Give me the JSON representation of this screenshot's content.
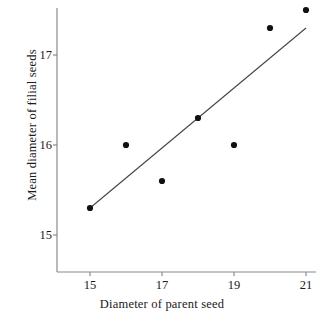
{
  "chart_data": {
    "type": "scatter",
    "title": "",
    "xlabel": "Diameter of parent seed",
    "ylabel": "Mean diameter of filial seeds",
    "x": [
      15,
      16,
      17,
      18,
      19,
      20,
      21
    ],
    "y": [
      15.3,
      16.0,
      15.6,
      16.3,
      16.0,
      17.3,
      17.5
    ],
    "points": [
      {
        "x": 15,
        "y": 15.3
      },
      {
        "x": 16,
        "y": 16.0
      },
      {
        "x": 17,
        "y": 15.6
      },
      {
        "x": 18,
        "y": 16.3
      },
      {
        "x": 19,
        "y": 16.0
      },
      {
        "x": 20,
        "y": 17.3
      },
      {
        "x": 21,
        "y": 17.5
      }
    ],
    "xlim": [
      14.2,
      21.4
    ],
    "ylim": [
      14.5,
      17.75
    ],
    "xticks": [
      15,
      17,
      19,
      21
    ],
    "yticks": [
      15,
      16,
      17
    ],
    "xticklabels": [
      "15",
      "17",
      "19",
      "21"
    ],
    "yticklabels": [
      "15",
      "16",
      "17"
    ],
    "grid": false,
    "legend": null,
    "marker_color": "#111111",
    "line_color": "#444444",
    "axis_color": "#8a8a8a",
    "trendline": {
      "label": "regression line",
      "x1": 15.0,
      "y1": 15.3,
      "x2": 21.0,
      "y2": 17.3
    }
  }
}
